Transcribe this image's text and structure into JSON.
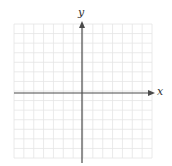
{
  "diagram": {
    "type": "coordinate-plane",
    "grid": {
      "left": 14,
      "top": 24,
      "right": 152,
      "bottom": 158,
      "cols": 14,
      "rows": 14,
      "color": "#e4e4e4"
    },
    "origin": {
      "x": 82,
      "y": 93
    },
    "axis_color": "#4a4a4a",
    "x_axis": {
      "label": "x"
    },
    "y_axis": {
      "label": "y"
    }
  }
}
